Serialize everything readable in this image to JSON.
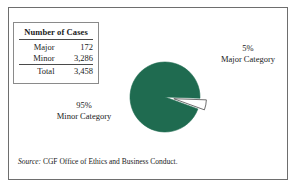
{
  "figure": {
    "table": {
      "title": "Number of Cases",
      "rows": [
        {
          "label": "Major",
          "value": "172"
        },
        {
          "label": "Minor",
          "value": "3,286"
        },
        {
          "label": "Total",
          "value": "3,458"
        }
      ]
    },
    "labels": {
      "major": {
        "percent": "5%",
        "name": "Major Category"
      },
      "minor": {
        "percent": "95%",
        "name": "Minor Category"
      }
    },
    "source": {
      "prefix": "Source:",
      "text": "CGF Office of Ethics and Business Conduct."
    },
    "colors": {
      "pie_fill": "#1f6b50",
      "pie_exploded_fill": "#ffffff",
      "outline": "#4a4a4a",
      "frame": "#6e6e6e",
      "background": "#ffffff"
    }
  },
  "chart_data": {
    "type": "pie",
    "title": "Number of Cases",
    "categories": [
      "Minor Category",
      "Major Category"
    ],
    "values": [
      95,
      5
    ],
    "counts": [
      3286,
      172
    ],
    "total": 3458,
    "value_unit": "percent",
    "data_labels": [
      "95%",
      "5%"
    ],
    "legend": "none",
    "exploded_slices": [
      "Major Category"
    ],
    "start_angle_deg": 20,
    "direction": "clockwise",
    "slice_colors": [
      "#1f6b50",
      "#ffffff"
    ],
    "annotations": [
      "95% Minor Category",
      "5% Major Category"
    ],
    "source": "Source: CGF Office of Ethics and Business Conduct."
  }
}
